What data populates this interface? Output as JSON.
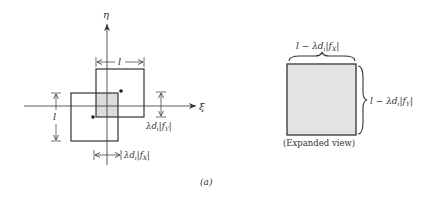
{
  "figure": {
    "panel_label": "(a)",
    "left_diagram": {
      "axis_vertical_label": "η",
      "axis_horizontal_label": "ξ",
      "top_dimension_label": "l",
      "left_dimension_label": "l",
      "right_dimension_label": "λd",
      "right_dimension_sub": "i",
      "right_dimension_tail": "|f",
      "right_dimension_tail_sub": "Y",
      "bottom_dimension_label": "λd",
      "bottom_dimension_sub": "i",
      "bottom_dimension_tail": "|f",
      "bottom_dimension_tail_sub": "X"
    },
    "right_diagram": {
      "top_label_prefix": "l − λd",
      "top_label_sub": "i",
      "top_label_tail": "|f",
      "top_label_tail_sub": "X",
      "side_label_prefix": "l − λd",
      "side_label_sub": "i",
      "side_label_tail": "|f",
      "side_label_tail_sub": "Y",
      "caption": "(Expanded view)"
    },
    "colors": {
      "line": "#333333",
      "overlap_fill": "#dcdcdc",
      "expanded_fill": "#e3e3e3"
    }
  }
}
